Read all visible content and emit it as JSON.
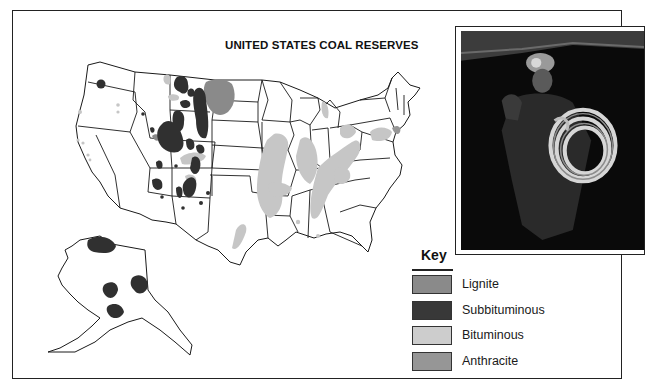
{
  "map": {
    "title": "UNITED STATES COAL RESERVES",
    "region": "United States including Alaska",
    "colors": {
      "state_border": "#1a1a1a",
      "land": "#ffffff"
    }
  },
  "legend": {
    "title": "Key",
    "items": [
      {
        "label": "Lignite",
        "color": "#8a8a8a"
      },
      {
        "label": "Subbituminous",
        "color": "#383838"
      },
      {
        "label": "Bituminous",
        "color": "#cdcdcd"
      },
      {
        "label": "Anthracite",
        "color": "#969696"
      }
    ]
  },
  "photo": {
    "subject": "coal miner with helmet lamp holding coiled cable"
  }
}
